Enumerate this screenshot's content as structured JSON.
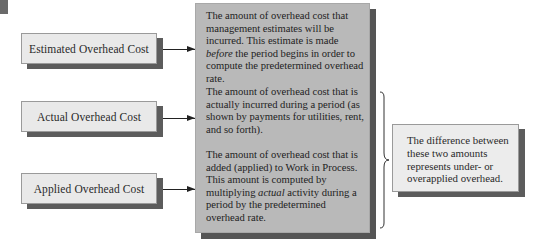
{
  "diagram": {
    "inputs": [
      {
        "label": "Estimated Overhead Cost"
      },
      {
        "label": "Actual Overhead Cost"
      },
      {
        "label": "Applied Overhead Cost"
      }
    ],
    "descriptions": [
      {
        "pre": "The amount of overhead cost that management estimates will be incurred. This estimate is made ",
        "emphasis": "before",
        "post": " the period begins in order to compute the predetermined overhead rate."
      },
      {
        "pre": "The amount of overhead cost that is actually incurred during a period (as shown by payments for utilities, rent, and so forth).",
        "emphasis": "",
        "post": ""
      },
      {
        "pre": "The amount of overhead cost that is added (applied) to Work in Process. This amount is computed by multiplying ",
        "emphasis": "actual",
        "post": " activity during a period by the predetermined overhead rate."
      }
    ],
    "result": {
      "text": "The difference between these two amounts represents under- or overapplied overhead."
    },
    "colors": {
      "main_box_fill": "#b9b9b9",
      "label_box_fill": "#e9e9e9",
      "shadow": "#555555",
      "arrow": "#222222"
    }
  }
}
